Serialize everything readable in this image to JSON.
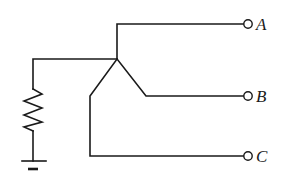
{
  "diagram": {
    "type": "circuit-schematic",
    "colors": {
      "line": "#1a1a1a",
      "background": "#ffffff"
    },
    "terminals": [
      {
        "id": "A",
        "label": "A"
      },
      {
        "id": "B",
        "label": "B"
      },
      {
        "id": "C",
        "label": "C"
      }
    ],
    "components": [
      {
        "type": "resistor",
        "orientation": "vertical"
      },
      {
        "type": "ground"
      }
    ]
  }
}
